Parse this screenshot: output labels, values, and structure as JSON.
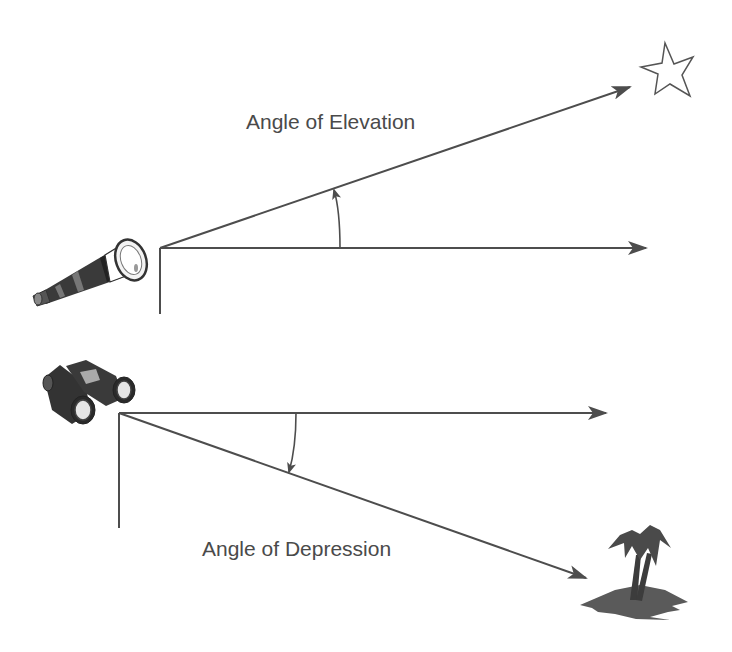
{
  "diagram": {
    "labels": {
      "elevation": "Angle of Elevation",
      "depression": "Angle of Depression"
    },
    "colors": {
      "line": "#4d4d4d",
      "text": "#4a4a4a",
      "fill_dark": "#3a3a3a",
      "island": "#555555"
    },
    "icons": {
      "observer_top": "telescope-icon",
      "target_top": "star-icon",
      "observer_bottom": "binoculars-icon",
      "target_bottom": "palm-island-icon"
    }
  }
}
